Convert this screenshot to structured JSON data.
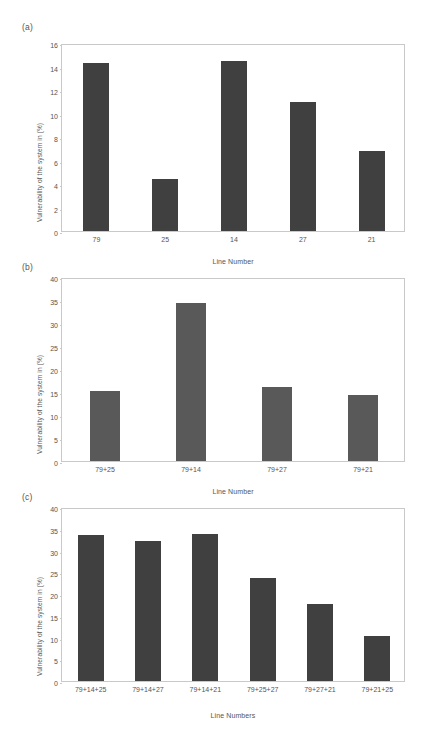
{
  "figure": {
    "background_color": "#ffffff",
    "axis_color": "#c9c9c9",
    "text_color": "#555555"
  },
  "panels": [
    {
      "tag": "(a)",
      "bar_color": "#404040",
      "chart_data": {
        "type": "bar",
        "title": "",
        "xlabel": "Line Number",
        "ylabel": "Vulnerability of the system in (%)",
        "categories": [
          "79",
          "25",
          "14",
          "27",
          "21"
        ],
        "values": [
          14.3,
          4.4,
          14.5,
          11.0,
          6.8
        ],
        "ylim": [
          0,
          16
        ],
        "yticks": [
          0,
          2,
          4,
          6,
          8,
          10,
          12,
          14,
          16
        ],
        "ytick_labels": [
          "0",
          "2",
          "4",
          "6",
          "8",
          "10",
          "12",
          "14",
          "16"
        ],
        "grid": false,
        "legend": "none"
      }
    },
    {
      "tag": "(b)",
      "bar_color": "#595959",
      "chart_data": {
        "type": "bar",
        "title": "",
        "xlabel": "Line Number",
        "ylabel": "Vulnerability of the system in (%)",
        "categories": [
          "79+25",
          "79+14",
          "79+27",
          "79+21"
        ],
        "values": [
          15.2,
          34.3,
          16.1,
          14.4
        ],
        "ylim": [
          0,
          40
        ],
        "yticks": [
          0,
          5,
          10,
          15,
          20,
          25,
          30,
          35,
          40
        ],
        "ytick_labels": [
          "0",
          "5",
          "10",
          "15",
          "20",
          "25",
          "30",
          "35",
          "40"
        ],
        "grid": false,
        "legend": "none"
      }
    },
    {
      "tag": "(c)",
      "bar_color": "#404040",
      "chart_data": {
        "type": "bar",
        "title": "",
        "xlabel": "Line Numbers",
        "ylabel": "Vulnerability of the system in (%)",
        "categories": [
          "79+14+25",
          "79+14+27",
          "79+14+21",
          "79+25+27",
          "79+27+21",
          "79+21+25"
        ],
        "values": [
          33.5,
          32.3,
          33.8,
          23.6,
          17.8,
          10.4
        ],
        "ylim": [
          0,
          40
        ],
        "yticks": [
          0,
          5,
          10,
          15,
          20,
          25,
          30,
          35,
          40
        ],
        "ytick_labels": [
          "0",
          "5",
          "10",
          "15",
          "20",
          "25",
          "30",
          "35",
          "40"
        ],
        "grid": false,
        "legend": "none"
      }
    }
  ]
}
